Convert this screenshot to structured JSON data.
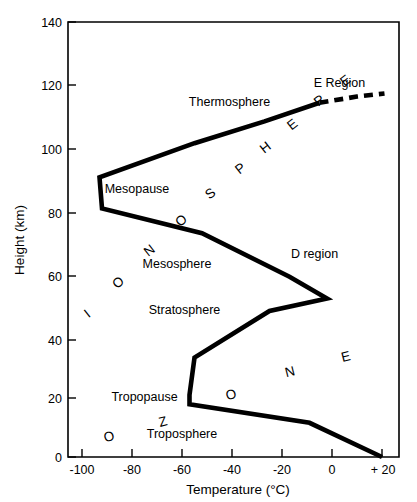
{
  "chart_data": {
    "type": "line",
    "title": "",
    "xlabel": "Temperature (°C)",
    "ylabel": "Height (km)",
    "xlim": [
      -110,
      28
    ],
    "ylim": [
      0,
      140
    ],
    "grid": false,
    "legend": "none",
    "x_ticks": [
      "-100",
      "-80",
      "-60",
      "-40",
      "-20",
      "0",
      "+ 20"
    ],
    "x_tick_values": [
      -100,
      -80,
      -60,
      -40,
      -20,
      0,
      20
    ],
    "y_ticks": [
      "0",
      "20",
      "40",
      "60",
      "80",
      "100",
      "120",
      "140"
    ],
    "y_tick_values": [
      0,
      20,
      40,
      60,
      80,
      100,
      120,
      140
    ],
    "series": [
      {
        "name": "Standard atmosphere temperature profile",
        "style": "solid",
        "points": [
          {
            "temperature": 20,
            "height": 0
          },
          {
            "temperature": -9,
            "height": 11
          },
          {
            "temperature": -57,
            "height": 17
          },
          {
            "temperature": -57,
            "height": 20
          },
          {
            "temperature": -55,
            "height": 32
          },
          {
            "temperature": -25,
            "height": 47
          },
          {
            "temperature": -2,
            "height": 51
          },
          {
            "temperature": -17,
            "height": 58
          },
          {
            "temperature": -52,
            "height": 72
          },
          {
            "temperature": -92,
            "height": 80
          },
          {
            "temperature": -93,
            "height": 90
          },
          {
            "temperature": -55,
            "height": 101
          },
          {
            "temperature": -27,
            "height": 108
          },
          {
            "temperature": -5,
            "height": 114
          }
        ]
      },
      {
        "name": "Thermosphere extrapolation",
        "style": "dashed",
        "points": [
          {
            "temperature": -5,
            "height": 114
          },
          {
            "temperature": 10,
            "height": 116
          },
          {
            "temperature": 21,
            "height": 117
          }
        ]
      }
    ],
    "annotations": {
      "layers": [
        {
          "label": "Thermosphere",
          "temperature": -41,
          "height": 113
        },
        {
          "label": "Mesopause",
          "temperature": -78,
          "height": 85
        },
        {
          "label": "Mesosphere",
          "temperature": -62,
          "height": 61
        },
        {
          "label": "Stratosphere",
          "temperature": -59,
          "height": 46
        },
        {
          "label": "Tropopause",
          "temperature": -75,
          "height": 18
        },
        {
          "label": "Troposphere",
          "temperature": -60,
          "height": 6
        }
      ],
      "regions": [
        {
          "label": "E Region",
          "temperature": 3,
          "height": 119
        },
        {
          "label": "D region",
          "temperature": -7,
          "height": 64
        }
      ],
      "word_ionosphere": {
        "text": "IONOSPHERE",
        "letters": [
          {
            "char": "I",
            "x": 90,
            "y": 317,
            "rotate": -38
          },
          {
            "char": "O",
            "x": 121,
            "y": 286,
            "rotate": -38
          },
          {
            "char": "N",
            "x": 152,
            "y": 254,
            "rotate": -38
          },
          {
            "char": "O",
            "x": 184,
            "y": 224,
            "rotate": -38
          },
          {
            "char": "S",
            "x": 213,
            "y": 197,
            "rotate": -38
          },
          {
            "char": "P",
            "x": 243,
            "y": 172,
            "rotate": -38
          },
          {
            "char": "H",
            "x": 268,
            "y": 151,
            "rotate": -38
          },
          {
            "char": "E",
            "x": 295,
            "y": 128,
            "rotate": -38
          },
          {
            "char": "R",
            "x": 322,
            "y": 104,
            "rotate": -38
          },
          {
            "char": "E",
            "x": 348,
            "y": 84,
            "rotate": -38
          }
        ]
      },
      "word_ozone": {
        "text": "OZONE",
        "letters": [
          {
            "char": "O",
            "x": 110,
            "y": 441,
            "rotate": -14
          },
          {
            "char": "Z",
            "x": 164,
            "y": 426,
            "rotate": -14
          },
          {
            "char": "O",
            "x": 232,
            "y": 399,
            "rotate": -14
          },
          {
            "char": "N",
            "x": 291,
            "y": 376,
            "rotate": -14
          },
          {
            "char": "E",
            "x": 347,
            "y": 361,
            "rotate": -14
          }
        ]
      }
    }
  },
  "colors": {
    "line": "#000000",
    "axis": "#000000",
    "background": "#ffffff"
  }
}
